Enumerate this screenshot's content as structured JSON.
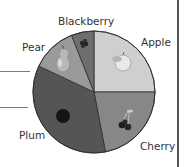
{
  "chart_data": {
    "type": "pie",
    "title": "",
    "categories": [
      "Apple",
      "Cherry",
      "Plum",
      "Pear",
      "Blackberry"
    ],
    "values": [
      25,
      22,
      35,
      12,
      6
    ],
    "unit": "percent (estimated from slice angles)",
    "start_angle_deg": 0,
    "direction": "clockwise",
    "colors": [
      "#cfcfcf",
      "#878787",
      "#555555",
      "#9a9a9a",
      "#6e6e6e"
    ],
    "slice_icons": [
      "apple-icon",
      "cherry-icon",
      "plum-icon",
      "pear-icon",
      "blackberry-icon"
    ],
    "legend": "none (labels placed outside slices)",
    "grid": false
  },
  "labels": {
    "apple": "Apple",
    "cherry": "Cherry",
    "plum": "Plum",
    "pear": "Pear",
    "blackberry": "Blackberry"
  }
}
